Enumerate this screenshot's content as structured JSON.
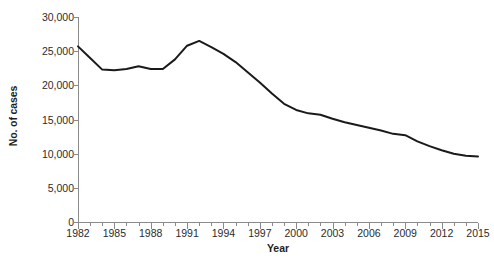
{
  "chart_data": {
    "type": "line",
    "title": "",
    "xlabel": "Year",
    "ylabel": "No. of cases",
    "xlim": [
      1982,
      2015
    ],
    "ylim": [
      0,
      30000
    ],
    "grid": false,
    "legend": null,
    "y_ticks": [
      0,
      5000,
      10000,
      15000,
      20000,
      25000,
      30000
    ],
    "y_tick_labels": [
      "0",
      "5,000",
      "10,000",
      "15,000",
      "20,000",
      "25,000",
      "30,000"
    ],
    "x_ticks": [
      1982,
      1985,
      1988,
      1991,
      1994,
      1997,
      2000,
      2003,
      2006,
      2009,
      2012,
      2015
    ],
    "x_tick_labels": [
      "1982",
      "1985",
      "1988",
      "1991",
      "1994",
      "1997",
      "2000",
      "2003",
      "2006",
      "2009",
      "2012",
      "2015"
    ],
    "x_minor_tick_step": 1,
    "line_color": "#1a1a1a",
    "line_width": 2,
    "axis_color": "#8a8a8a",
    "x": [
      1982,
      1983,
      1984,
      1985,
      1986,
      1987,
      1988,
      1989,
      1990,
      1991,
      1992,
      1993,
      1994,
      1995,
      1996,
      1997,
      1998,
      1999,
      2000,
      2001,
      2002,
      2003,
      2004,
      2005,
      2006,
      2007,
      2008,
      2009,
      2010,
      2011,
      2012,
      2013,
      2014,
      2015
    ],
    "series": [
      {
        "name": "No. of cases",
        "values": [
          25700,
          24000,
          22300,
          22200,
          22400,
          22800,
          22400,
          22400,
          23800,
          25800,
          26500,
          25600,
          24600,
          23400,
          21900,
          20400,
          18800,
          17300,
          16400,
          15900,
          15700,
          15100,
          14600,
          14200,
          13800,
          13400,
          12900,
          12700,
          11800,
          11100,
          10500,
          10000,
          9700,
          9600
        ]
      }
    ]
  },
  "artifact": {
    "bottom_left_scan_text": ""
  }
}
